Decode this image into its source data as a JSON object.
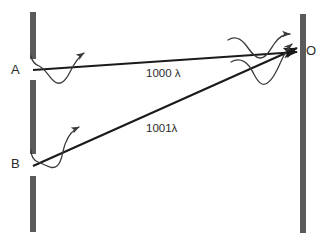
{
  "diagram": {
    "colors": {
      "barrier": "#5a5a5a",
      "ray": "#1a1a1a",
      "wave": "#3a3a3a",
      "text": "#2b2b2b",
      "background": "#ffffff"
    },
    "barriers": [
      {
        "name": "left-barrier",
        "x": 30,
        "y_top": 12,
        "y_bottom": 232,
        "width": 6,
        "has_slits": true
      },
      {
        "name": "right-barrier",
        "x": 300,
        "y_top": 14,
        "y_bottom": 233,
        "width": 6,
        "has_slits": false
      }
    ],
    "sources": [
      {
        "id": "A",
        "label": "A",
        "x": 33,
        "y": 70
      },
      {
        "id": "B",
        "label": "B",
        "x": 33,
        "y": 166
      }
    ],
    "observation_point": {
      "id": "O",
      "label": "O",
      "x": 300,
      "y": 52
    },
    "rays": [
      {
        "name": "ray-a-to-o",
        "from": "A",
        "to": "O",
        "path_length_label": "1000 λ",
        "path_length_value": 1000,
        "unit": "λ"
      },
      {
        "name": "ray-b-to-o",
        "from": "B",
        "to": "O",
        "path_length_label": "1001λ",
        "path_length_value": 1001,
        "unit": "λ"
      }
    ],
    "wave_markers": [
      {
        "name": "wavelet-at-a",
        "near": "A"
      },
      {
        "name": "wavelet-at-b",
        "near": "B"
      },
      {
        "name": "wavelet-upper-at-o",
        "near": "O"
      },
      {
        "name": "wavelet-lower-at-o",
        "near": "O"
      }
    ],
    "arrow_count": 4
  }
}
